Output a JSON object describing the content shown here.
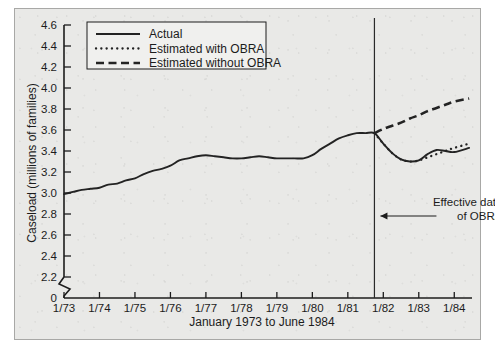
{
  "chart_data": {
    "type": "line",
    "title": "",
    "xlabel": "January 1973 to June 1984",
    "ylabel": "Caseload (millions of families)",
    "xlim": [
      1973.0,
      1984.5
    ],
    "ylim": [
      2.1,
      4.6
    ],
    "ybreak": true,
    "ybreak_label": "0",
    "grid": false,
    "legend_position": "top-left",
    "xticklabels": [
      "1/73",
      "1/74",
      "1/75",
      "1/76",
      "1/77",
      "1/78",
      "1/79",
      "1/80",
      "1/81",
      "1/82",
      "1/83",
      "1/84"
    ],
    "xtickvalues": [
      1973,
      1974,
      1975,
      1976,
      1977,
      1978,
      1979,
      1980,
      1981,
      1982,
      1983,
      1984
    ],
    "yticklabels": [
      "2.2",
      "2.4",
      "2.6",
      "2.8",
      "3.0",
      "3.2",
      "3.4",
      "3.6",
      "3.8",
      "4.0",
      "4.2",
      "4.4",
      "4.6"
    ],
    "ytickvalues": [
      2.2,
      2.4,
      2.6,
      2.8,
      3.0,
      3.2,
      3.4,
      3.6,
      3.8,
      4.0,
      4.2,
      4.4,
      4.6
    ],
    "annotations": [
      {
        "name": "obra-effective-date",
        "line1": "Effective date",
        "line2": "of OBRA",
        "x": 1981.75,
        "arrow": "left"
      }
    ],
    "series": [
      {
        "name": "Actual",
        "style": "solid",
        "x": [
          1973.0,
          1973.25,
          1973.5,
          1973.75,
          1974.0,
          1974.25,
          1974.5,
          1974.75,
          1975.0,
          1975.25,
          1975.5,
          1975.75,
          1976.0,
          1976.25,
          1976.5,
          1976.75,
          1977.0,
          1977.25,
          1977.5,
          1977.75,
          1978.0,
          1978.25,
          1978.5,
          1978.75,
          1979.0,
          1979.25,
          1979.5,
          1979.75,
          1980.0,
          1980.25,
          1980.5,
          1980.75,
          1981.0,
          1981.25,
          1981.5,
          1981.75,
          1982.0,
          1982.25,
          1982.5,
          1982.75,
          1983.0,
          1983.25,
          1983.5,
          1983.75,
          1984.0,
          1984.42
        ],
        "y": [
          2.99,
          3.01,
          3.03,
          3.04,
          3.05,
          3.08,
          3.09,
          3.12,
          3.14,
          3.18,
          3.21,
          3.23,
          3.26,
          3.31,
          3.33,
          3.35,
          3.36,
          3.35,
          3.34,
          3.33,
          3.33,
          3.34,
          3.35,
          3.34,
          3.33,
          3.33,
          3.33,
          3.33,
          3.36,
          3.42,
          3.47,
          3.52,
          3.55,
          3.57,
          3.57,
          3.57,
          3.47,
          3.38,
          3.32,
          3.3,
          3.31,
          3.37,
          3.41,
          3.4,
          3.39,
          3.43
        ]
      },
      {
        "name": "Estimated with OBRA",
        "style": "dotted",
        "x": [
          1981.75,
          1982.0,
          1982.25,
          1982.5,
          1982.75,
          1983.0,
          1983.25,
          1983.5,
          1983.75,
          1984.0,
          1984.42
        ],
        "y": [
          3.57,
          3.47,
          3.38,
          3.32,
          3.3,
          3.31,
          3.34,
          3.37,
          3.4,
          3.43,
          3.47
        ]
      },
      {
        "name": "Estimated without OBRA",
        "style": "dashed",
        "x": [
          1981.75,
          1982.0,
          1982.25,
          1982.5,
          1982.75,
          1983.0,
          1983.25,
          1983.5,
          1983.75,
          1984.0,
          1984.42
        ],
        "y": [
          3.57,
          3.61,
          3.64,
          3.67,
          3.71,
          3.74,
          3.78,
          3.81,
          3.84,
          3.87,
          3.9
        ]
      }
    ]
  },
  "legend": {
    "items": [
      {
        "label": "Actual",
        "style": "solid"
      },
      {
        "label": "Estimated with OBRA",
        "style": "dotted"
      },
      {
        "label": "Estimated without OBRA",
        "style": "dashed"
      }
    ]
  },
  "colors": {
    "ink": "#232323",
    "background": "#e9e9e7",
    "frame_border": "#a8a8a6"
  }
}
